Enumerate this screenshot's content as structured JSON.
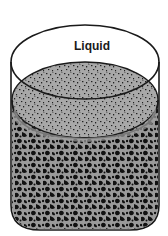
{
  "diagram": {
    "type": "cylinder-container",
    "labels": {
      "liquid": "Liquid"
    },
    "regions": [
      {
        "name": "liquid",
        "description": "clear liquid layer above sediment"
      },
      {
        "name": "sediment-surface",
        "description": "speckled gray top surface of porous solid"
      },
      {
        "name": "porous-solid",
        "description": "dark mottled porous material filling lower container"
      }
    ],
    "colors": {
      "outline": "#1a1a1a",
      "surface_gray": "#a8a8a8",
      "solid_gray": "#9a9a9a",
      "pore_black": "#111111",
      "background": "#ffffff"
    }
  }
}
